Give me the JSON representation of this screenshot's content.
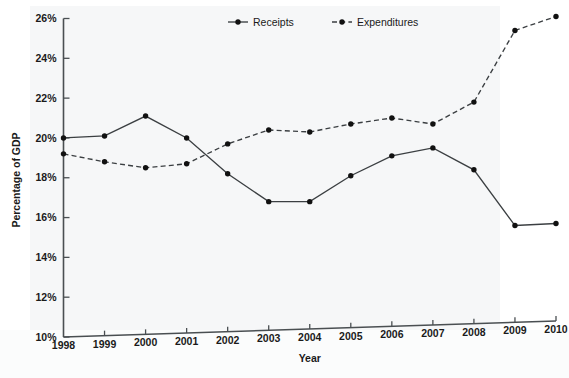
{
  "chart_data": {
    "type": "line",
    "title": "",
    "xlabel": "Year",
    "ylabel": "Percentage of GDP",
    "x": [
      1998,
      1999,
      2000,
      2001,
      2002,
      2003,
      2004,
      2005,
      2006,
      2007,
      2008,
      2009,
      2010
    ],
    "categories": [
      "1998",
      "1999",
      "2000",
      "2001",
      "2002",
      "2003",
      "2004",
      "2005",
      "2006",
      "2007",
      "2008",
      "2009",
      "2010"
    ],
    "xlim": [
      1998,
      2010
    ],
    "ylim": [
      10,
      26
    ],
    "ytick_values": [
      10,
      12,
      14,
      16,
      18,
      20,
      22,
      24,
      26
    ],
    "ytick_labels": [
      "10%",
      "12%",
      "14%",
      "16%",
      "18%",
      "20%",
      "22%",
      "24%",
      "26%"
    ],
    "xtick_labels": [
      "1998",
      "1999",
      "2000",
      "2001",
      "2002",
      "2003",
      "2004",
      "2005",
      "2006",
      "2007",
      "2008",
      "2009",
      "2010"
    ],
    "grid": false,
    "legend_position": "top-center",
    "series": [
      {
        "name": "Receipts",
        "style": "solid",
        "marker": "filled-circle",
        "color": "#3b3f42",
        "values": [
          20.0,
          20.1,
          21.1,
          20.0,
          18.2,
          16.8,
          16.8,
          18.1,
          19.1,
          19.5,
          18.4,
          15.6,
          15.7
        ]
      },
      {
        "name": "Expenditures",
        "style": "dashed",
        "marker": "filled-circle",
        "color": "#3b3f42",
        "values": [
          19.2,
          18.8,
          18.5,
          18.7,
          19.7,
          20.4,
          20.3,
          20.7,
          21.0,
          20.7,
          21.8,
          25.4,
          26.1
        ]
      }
    ]
  },
  "legend": {
    "items": [
      {
        "label": "Receipts"
      },
      {
        "label": "Expenditures"
      }
    ]
  },
  "caption": {
    "text": ""
  }
}
